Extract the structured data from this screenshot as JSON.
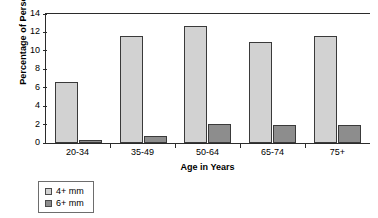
{
  "chart_data": {
    "type": "bar",
    "title": "",
    "xlabel": "Age in Years",
    "ylabel": "Percentage of Persons",
    "categories": [
      "20-34",
      "35-49",
      "50-64",
      "65-74",
      "75+"
    ],
    "series": [
      {
        "name": "4+ mm",
        "color": "#d2d2d2",
        "values": [
          6.6,
          11.6,
          12.7,
          11.0,
          11.6
        ]
      },
      {
        "name": "6+ mm",
        "color": "#8d8d8d",
        "values": [
          0.3,
          0.8,
          2.1,
          2.0,
          2.0
        ]
      }
    ],
    "ylim": [
      0,
      14
    ],
    "yticks": [
      0,
      2,
      4,
      6,
      8,
      10,
      12,
      14
    ],
    "ytick_labels": [
      "0",
      "2",
      "4",
      "6",
      "8",
      "10",
      "12",
      "14"
    ],
    "grid": false,
    "legend_position": "bottom-left",
    "legend_entries": [
      "4+ mm",
      "6+ mm"
    ]
  }
}
